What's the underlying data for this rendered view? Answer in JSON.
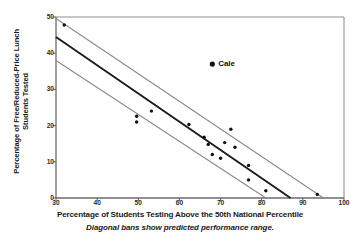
{
  "chart_data": {
    "type": "scatter",
    "title": "",
    "xlabel": "Percentage of Students Testing Above the 50th National Percentile",
    "ylabel_line1": "Percentage of Free/Reduced-Price Lunch",
    "ylabel_line2": "Students Tested",
    "caption": "Diagonal bans show predicted performance range.",
    "xlim": [
      30,
      100
    ],
    "ylim": [
      0,
      50
    ],
    "xticks": [
      30,
      40,
      50,
      60,
      70,
      80,
      90,
      100
    ],
    "yticks": [
      0,
      10,
      20,
      30,
      40,
      50
    ],
    "grid": false,
    "legend": "none",
    "points": [
      {
        "x": 32.0,
        "y": 47.8
      },
      {
        "x": 49.6,
        "y": 22.6
      },
      {
        "x": 49.6,
        "y": 21.0
      },
      {
        "x": 53.2,
        "y": 24.0
      },
      {
        "x": 62.3,
        "y": 20.3
      },
      {
        "x": 66.0,
        "y": 16.8
      },
      {
        "x": 67.0,
        "y": 14.8
      },
      {
        "x": 68.0,
        "y": 12.0
      },
      {
        "x": 72.5,
        "y": 19.0
      },
      {
        "x": 71.0,
        "y": 15.3
      },
      {
        "x": 73.5,
        "y": 14.0
      },
      {
        "x": 70.0,
        "y": 11.0
      },
      {
        "x": 76.8,
        "y": 9.0
      },
      {
        "x": 76.8,
        "y": 5.0
      },
      {
        "x": 81.0,
        "y": 2.0
      },
      {
        "x": 93.5,
        "y": 1.0
      }
    ],
    "annotated_point": {
      "x": 68.0,
      "y": 37.0,
      "label": "Cale"
    },
    "fit_line": {
      "name": "predicted performance",
      "x_start": 30,
      "y_start": 44.5,
      "x_end": 87.0,
      "y_end": 0
    },
    "bands": [
      {
        "name": "upper band",
        "x_start": 30,
        "y_start": 49.6,
        "x_end": 95.0,
        "y_end": 0
      },
      {
        "name": "lower band",
        "x_start": 30,
        "y_start": 38.0,
        "x_end": 81.0,
        "y_end": 0
      }
    ],
    "colors": {
      "point": "#111111",
      "fit_line": "#1a1a1a",
      "band": "#8a8a8a",
      "axis": "#6b6b6b",
      "frame": "#8a8a8a"
    }
  }
}
